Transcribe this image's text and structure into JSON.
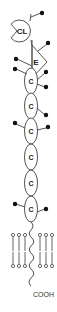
{
  "diagram": {
    "domains": {
      "cl": {
        "label": "CL"
      },
      "e": {
        "label": "E"
      },
      "c": [
        {
          "label": "C"
        },
        {
          "label": "C"
        },
        {
          "label": "C"
        },
        {
          "label": "C"
        },
        {
          "label": "C"
        },
        {
          "label": "C"
        }
      ]
    },
    "terminus": {
      "label": "COOH"
    },
    "colors": {
      "stroke": "#555555",
      "dot": "#111111",
      "text": "#222222"
    }
  }
}
